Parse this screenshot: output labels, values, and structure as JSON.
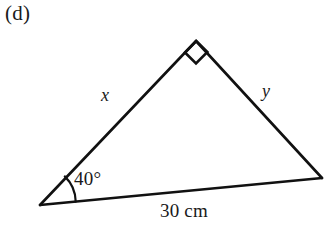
{
  "figure": {
    "part_label": "(d)",
    "caption": "",
    "background_color": "#ffffff",
    "stroke_color": "#111111"
  },
  "geometry": {
    "shape": "triangle",
    "vertices": {
      "bottom_left": {
        "name": "A",
        "x": 40,
        "y": 205
      },
      "apex": {
        "name": "B",
        "x": 196,
        "y": 41
      },
      "bottom_right": {
        "name": "C",
        "x": 322,
        "y": 178
      }
    },
    "right_angle_marker": {
      "at_vertex": "apex",
      "style": "square",
      "size": 15
    },
    "angle_arc": {
      "at_vertex": "bottom_left",
      "radius": 36
    }
  },
  "labels": {
    "side_x": "x",
    "side_y": "y",
    "angle": "40°",
    "base": "30 cm"
  }
}
